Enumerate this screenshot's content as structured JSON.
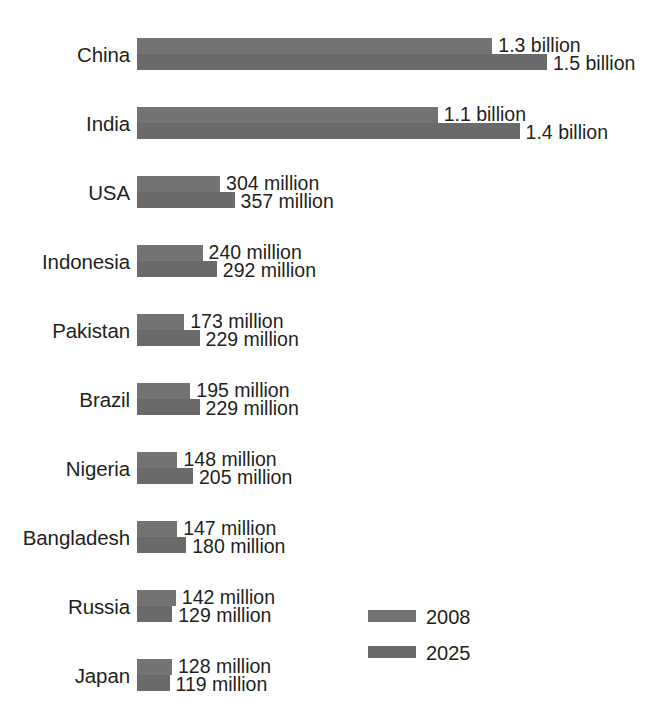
{
  "chart_data": {
    "type": "bar",
    "title": "",
    "subtitle": "",
    "xlabel": "",
    "ylabel": "",
    "orientation": "horizontal",
    "grid": false,
    "axis_visible": false,
    "legend_position": "bottom-right",
    "value_unit": "people",
    "xlim": [
      0,
      1500000000
    ],
    "categories": [
      "China",
      "India",
      "USA",
      "Indonesia",
      "Pakistan",
      "Brazil",
      "Nigeria",
      "Bangladesh",
      "Russia",
      "Japan"
    ],
    "series": [
      {
        "name": "2008",
        "color": "#737373",
        "values": [
          1300000000,
          1100000000,
          304000000,
          240000000,
          173000000,
          195000000,
          148000000,
          147000000,
          142000000,
          128000000
        ],
        "labels": [
          "1.3 billion",
          "1.1 billion",
          "304 million",
          "240 million",
          "173 million",
          "195 million",
          "148 million",
          "147 million",
          "142 million",
          "128 million"
        ]
      },
      {
        "name": "2025",
        "color": "#6a6a6a",
        "values": [
          1500000000,
          1400000000,
          357000000,
          292000000,
          229000000,
          229000000,
          205000000,
          180000000,
          129000000,
          119000000
        ],
        "labels": [
          "1.5 billion",
          "1.4 billion",
          "357 million",
          "292 million",
          "229 million",
          "229 million",
          "205 million",
          "180 million",
          "129 million",
          "119 million"
        ]
      }
    ]
  },
  "legend": {
    "items": [
      {
        "label": "2008",
        "color": "#737373"
      },
      {
        "label": "2025",
        "color": "#6a6a6a"
      }
    ]
  },
  "layout": {
    "bar_origin_x": 137,
    "px_per_million": 0.2733,
    "row_tops": [
      38,
      107,
      176,
      245,
      314,
      383,
      452,
      521,
      590,
      659
    ],
    "label_gap_px": 6
  }
}
